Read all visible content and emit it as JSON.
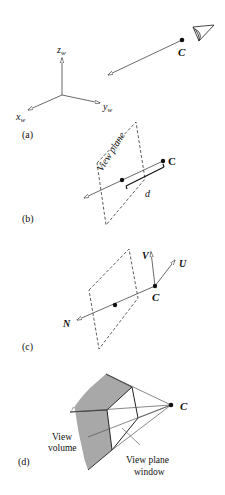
{
  "panel_a": {
    "label": "(a)",
    "axis_z": "z",
    "axis_z_sub": "w",
    "axis_x": "x",
    "axis_x_sub": "w",
    "axis_y": "y",
    "axis_y_sub": "w",
    "camera_label": "C"
  },
  "panel_b": {
    "label": "(b)",
    "plane_label": "View plane",
    "camera_label": "C",
    "distance_label": "d"
  },
  "panel_c": {
    "label": "(c)",
    "v_label": "V",
    "u_label": "U",
    "n_label": "N",
    "camera_label": "C"
  },
  "panel_d": {
    "label": "(d)",
    "camera_label": "C",
    "volume_label_1": "View",
    "volume_label_2": "volume",
    "window_label_1": "View plane",
    "window_label_2": "window"
  },
  "colors": {
    "ink": "#111111",
    "line": "#444444",
    "shade": "#a8a8a8"
  }
}
